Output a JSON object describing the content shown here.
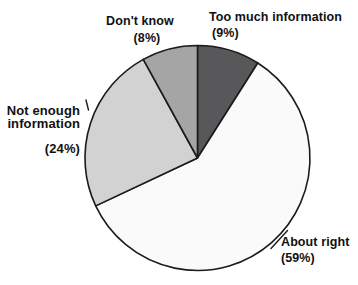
{
  "figure": {
    "background": "#ffffff",
    "text_color": "#111111"
  },
  "chart_data": {
    "type": "pie",
    "start_angle": "12-oclock",
    "direction": "clockwise",
    "legend": "none",
    "stroke_color": "#1b1b1b",
    "stroke_width": 1.6,
    "slices": [
      {
        "id": "too-much-information",
        "label": "Too much information",
        "pct_label": "(9%)",
        "value": 9,
        "color": "#58585a"
      },
      {
        "id": "about-right",
        "label": "About right",
        "pct_label": "(59%)",
        "value": 59,
        "color": "#fafafa"
      },
      {
        "id": "not-enough-information",
        "label": "Not enough\ninformation",
        "pct_label": "(24%)",
        "value": 24,
        "color": "#d2d2d2"
      },
      {
        "id": "dont-know",
        "label": "Don't know",
        "pct_label": "(8%)",
        "value": 8,
        "color": "#a5a5a5"
      }
    ]
  }
}
